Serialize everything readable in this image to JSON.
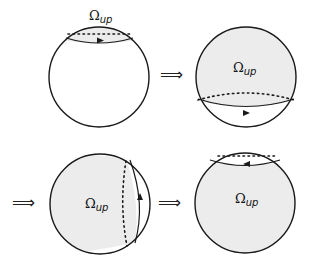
{
  "diagram": {
    "region_label": "Ω",
    "region_subscript": "up",
    "implies_symbol": "⟹",
    "colors": {
      "fill": "#ececec",
      "stroke": "#1a1a1a",
      "background": "#ffffff"
    },
    "panels": [
      {
        "id": "panel-1",
        "position": "top-left",
        "shaded": "small cap at top",
        "arrow_direction": "right"
      },
      {
        "id": "panel-2",
        "position": "top-right",
        "shaded": "large region above lower loop",
        "arrow_direction": "right"
      },
      {
        "id": "panel-3",
        "position": "bottom-left",
        "shaded": "large region left of vertical loop",
        "arrow_direction": "up"
      },
      {
        "id": "panel-4",
        "position": "bottom-right",
        "shaded": "sphere below top cap",
        "arrow_direction": "left"
      }
    ]
  }
}
